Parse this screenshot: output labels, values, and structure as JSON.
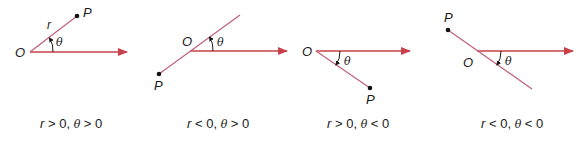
{
  "figure": {
    "colors": {
      "axis": "#c8404a",
      "ray": "#c0607a",
      "text": "#1a1a1a",
      "point": "#111111"
    },
    "panels": [
      {
        "id": "panel-1",
        "labels": {
          "origin": "O",
          "point": "P",
          "radius": "r",
          "angle": "θ"
        },
        "caption": {
          "r": "r",
          "rel1": " > 0, ",
          "theta": "θ",
          "rel2": " > 0"
        }
      },
      {
        "id": "panel-2",
        "labels": {
          "origin": "O",
          "point": "P",
          "angle": "θ"
        },
        "caption": {
          "r": "r",
          "rel1": " < 0, ",
          "theta": "θ",
          "rel2": " > 0"
        }
      },
      {
        "id": "panel-3",
        "labels": {
          "origin": "O",
          "point": "P",
          "angle": "θ"
        },
        "caption": {
          "r": "r",
          "rel1": " > 0, ",
          "theta": "θ",
          "rel2": " < 0"
        }
      },
      {
        "id": "panel-4",
        "labels": {
          "origin": "O",
          "point": "P",
          "angle": "θ"
        },
        "caption": {
          "r": "r",
          "rel1": " < 0, ",
          "theta": "θ",
          "rel2": " < 0"
        }
      }
    ]
  }
}
